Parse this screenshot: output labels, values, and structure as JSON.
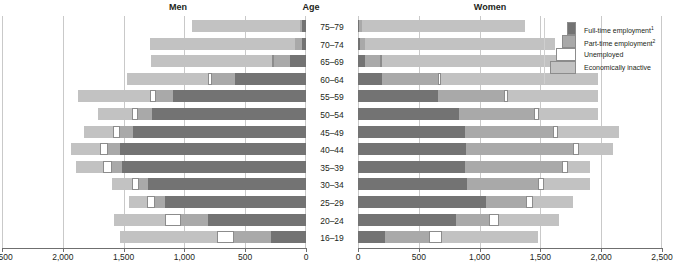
{
  "headers": {
    "men": "Men",
    "age": "Age",
    "women": "Women"
  },
  "legend": {
    "items": [
      {
        "label": "Full-time employment",
        "note": "1",
        "key": "full",
        "color": "#737373"
      },
      {
        "label": "Part-time employment",
        "note": "2",
        "key": "part",
        "color": "#a9a9a9"
      },
      {
        "label": "Unemployed",
        "note": "",
        "key": "unemp",
        "color": "#ffffff"
      },
      {
        "label": "Economically inactive",
        "note": "",
        "key": "inact",
        "color": "#c2c2c2"
      }
    ]
  },
  "axis": {
    "men_ticks": [
      "2,500",
      "2,000",
      "1,500",
      "1,000",
      "500",
      "0"
    ],
    "women_ticks": [
      "0",
      "500",
      "1,000",
      "1,500",
      "2,000",
      "2,500"
    ],
    "max": 2500,
    "step": 500
  },
  "chart_data": {
    "type": "bar",
    "subtype": "population-pyramid-stacked",
    "title": "",
    "xlabel": "",
    "ylabel": "Age",
    "xlim": [
      0,
      2500
    ],
    "grid": true,
    "legend_position": "right",
    "categories": [
      "75–79",
      "70–74",
      "65–69",
      "60–64",
      "55–59",
      "50–54",
      "45–49",
      "40–44",
      "35–39",
      "30–34",
      "25–29",
      "20–24",
      "16–19"
    ],
    "segment_order_men": [
      "full",
      "part",
      "unemp",
      "inact"
    ],
    "segment_order_women": [
      "full",
      "part",
      "unemp",
      "inact"
    ],
    "men": [
      {
        "age": "75–79",
        "full": 30,
        "part": 20,
        "unemp": 0,
        "inact": 890
      },
      {
        "age": "70–74",
        "full": 35,
        "part": 55,
        "unemp": 0,
        "inact": 1190
      },
      {
        "age": "65–69",
        "full": 130,
        "part": 130,
        "unemp": 15,
        "inact": 1000
      },
      {
        "age": "60–64",
        "full": 580,
        "part": 190,
        "unemp": 40,
        "inact": 660
      },
      {
        "age": "55–59",
        "full": 1090,
        "part": 140,
        "unemp": 55,
        "inact": 590
      },
      {
        "age": "50–54",
        "full": 1270,
        "part": 110,
        "unemp": 50,
        "inact": 280
      },
      {
        "age": "45–49",
        "full": 1420,
        "part": 110,
        "unemp": 60,
        "inact": 240
      },
      {
        "age": "40–44",
        "full": 1530,
        "part": 95,
        "unemp": 70,
        "inact": 235
      },
      {
        "age": "35–39",
        "full": 1510,
        "part": 85,
        "unemp": 75,
        "inact": 220
      },
      {
        "age": "30–34",
        "full": 1300,
        "part": 70,
        "unemp": 65,
        "inact": 160
      },
      {
        "age": "25–29",
        "full": 1160,
        "part": 80,
        "unemp": 70,
        "inact": 150
      },
      {
        "age": "20–24",
        "full": 810,
        "part": 220,
        "unemp": 130,
        "inact": 420
      },
      {
        "age": "16–19",
        "full": 290,
        "part": 300,
        "unemp": 140,
        "inact": 800
      }
    ],
    "women": [
      {
        "age": "75–79",
        "full": 10,
        "part": 20,
        "unemp": 0,
        "inact": 1340
      },
      {
        "age": "70–74",
        "full": 15,
        "part": 45,
        "unemp": 0,
        "inact": 1560
      },
      {
        "age": "65–69",
        "full": 55,
        "part": 130,
        "unemp": 10,
        "inact": 1570
      },
      {
        "age": "60–64",
        "full": 200,
        "part": 460,
        "unemp": 25,
        "inact": 1290
      },
      {
        "age": "55–59",
        "full": 660,
        "part": 540,
        "unemp": 35,
        "inact": 740
      },
      {
        "age": "50–54",
        "full": 830,
        "part": 620,
        "unemp": 40,
        "inact": 480
      },
      {
        "age": "45–49",
        "full": 880,
        "part": 720,
        "unemp": 45,
        "inact": 500
      },
      {
        "age": "40–44",
        "full": 890,
        "part": 880,
        "unemp": 50,
        "inact": 280
      },
      {
        "age": "35–39",
        "full": 880,
        "part": 800,
        "unemp": 45,
        "inact": 180
      },
      {
        "age": "30–34",
        "full": 900,
        "part": 580,
        "unemp": 50,
        "inact": 380
      },
      {
        "age": "25–29",
        "full": 1050,
        "part": 330,
        "unemp": 60,
        "inact": 330
      },
      {
        "age": "20–24",
        "full": 810,
        "part": 270,
        "unemp": 80,
        "inact": 490
      },
      {
        "age": "16–19",
        "full": 220,
        "part": 360,
        "unemp": 110,
        "inact": 790
      }
    ]
  }
}
